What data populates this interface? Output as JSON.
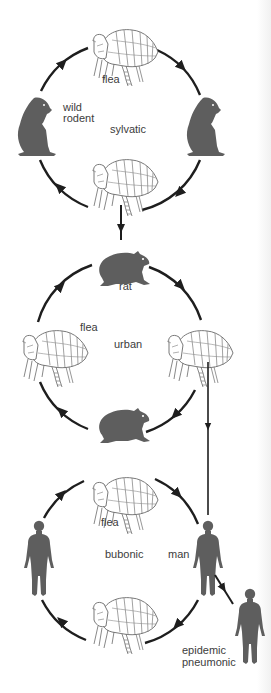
{
  "diagram": {
    "type": "plague transmission cycles",
    "colors": {
      "silhouette": "#5e5e5e",
      "line": "#1e1e1e",
      "flea_outline": "#6a6a6a",
      "text": "#3c3c3c"
    },
    "cycles": [
      {
        "name": "sylvatic",
        "label": "sylvatic",
        "nodes": [
          {
            "position": "top",
            "icon": "flea",
            "label": "flea"
          },
          {
            "position": "right",
            "icon": "wild-rodent",
            "label": ""
          },
          {
            "position": "bottom",
            "icon": "flea",
            "label": ""
          },
          {
            "position": "left",
            "icon": "wild-rodent",
            "label": "wild rodent"
          }
        ]
      },
      {
        "name": "urban",
        "label": "urban",
        "nodes": [
          {
            "position": "top",
            "icon": "rat",
            "label": "rat"
          },
          {
            "position": "right",
            "icon": "flea",
            "label": ""
          },
          {
            "position": "bottom",
            "icon": "rat",
            "label": ""
          },
          {
            "position": "left",
            "icon": "flea",
            "label": "flea"
          }
        ]
      },
      {
        "name": "bubonic",
        "label": "bubonic",
        "nodes": [
          {
            "position": "top",
            "icon": "flea",
            "label": "flea"
          },
          {
            "position": "right",
            "icon": "man",
            "label": "man"
          },
          {
            "position": "bottom",
            "icon": "flea",
            "label": ""
          },
          {
            "position": "left",
            "icon": "man",
            "label": ""
          }
        ]
      }
    ],
    "links": [
      {
        "from": "sylvatic.bottom-flea",
        "to": "urban.top-rat"
      },
      {
        "from": "urban.right-flea",
        "to": "bubonic.right-man"
      },
      {
        "from": "bubonic.right-man",
        "to": "epidemic-pneumonic-man"
      }
    ],
    "outlier": {
      "icon": "man",
      "label_line1": "epidemic",
      "label_line2": "pneumonic"
    }
  },
  "labels": {
    "sylvatic_flea": "flea",
    "wild": "wild",
    "rodent": "rodent",
    "sylvatic": "sylvatic",
    "rat": "rat",
    "urban_flea": "flea",
    "urban": "urban",
    "bubonic_flea": "flea",
    "bubonic": "bubonic",
    "man": "man",
    "epidemic": "epidemic",
    "pneumonic": "pneumonic"
  }
}
